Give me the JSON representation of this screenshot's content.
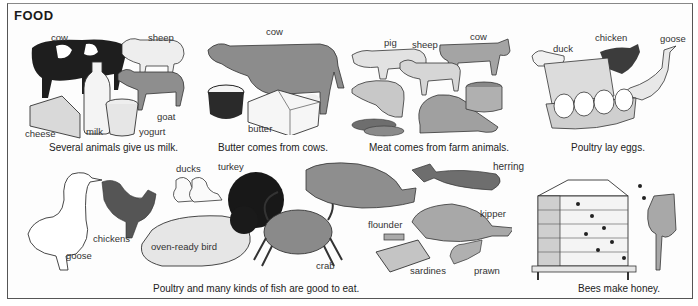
{
  "page": {
    "title": "FOOD"
  },
  "panels": {
    "milk": {
      "caption": "Several animals give us milk.",
      "labels": {
        "cow": "cow",
        "sheep": "sheep",
        "goat": "goat",
        "cheese": "cheese",
        "milk": "milk",
        "yogurt": "yogurt"
      }
    },
    "butter": {
      "caption": "Butter comes from cows.",
      "labels": {
        "cow": "cow",
        "butter": "butter"
      }
    },
    "meat": {
      "caption": "Meat comes from farm animals.",
      "labels": {
        "pig": "pig",
        "sheep": "sheep",
        "cow": "cow"
      }
    },
    "eggs": {
      "caption": "Poultry lay eggs.",
      "labels": {
        "duck": "duck",
        "chicken": "chicken",
        "goose": "goose"
      }
    },
    "poultry_fish": {
      "caption": "Poultry and many kinds of fish are good to eat.",
      "labels": {
        "goose": "goose",
        "chickens": "chickens",
        "ducks": "ducks",
        "turkey": "turkey",
        "oven_ready_bird": "oven-ready bird",
        "crab": "crab",
        "flounder": "flounder",
        "herring": "herring",
        "kipper": "kipper",
        "sardines": "sardines",
        "prawn": "prawn"
      }
    },
    "honey": {
      "caption": "Bees make honey."
    }
  },
  "colors": {
    "ink": "#222222",
    "grey_fill": "#9a9a9a",
    "light_fill": "#e8e8e8",
    "dark_fill": "#2a2a2a",
    "border": "#555555"
  }
}
